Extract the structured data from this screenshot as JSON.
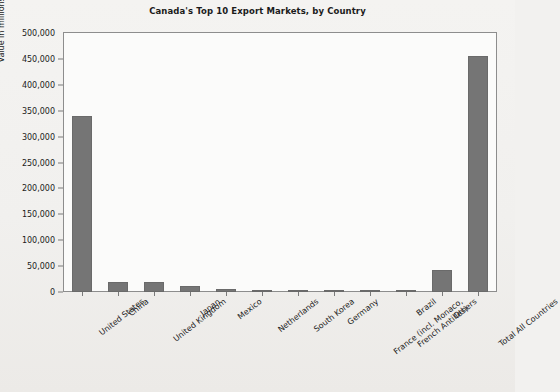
{
  "chart_data": {
    "type": "bar",
    "title": "Canada's Top 10 Export Markets, by Country",
    "xlabel": "",
    "ylabel": "Value in millions of CDN$",
    "ylim": [
      0,
      500000
    ],
    "ytick_step": 50000,
    "grid": false,
    "legend": "none",
    "bar_color": "#757575",
    "categories": [
      "United States",
      "China",
      "United Kingdom",
      "Japan",
      "Mexico",
      "Netherlands",
      "South Korea",
      "Germany",
      "France (incl. Monaco, French Antilles)",
      "Brazil",
      "Others",
      "Total All Countries"
    ],
    "category_lines": [
      [
        "United States"
      ],
      [
        "China"
      ],
      [
        "United Kingdom"
      ],
      [
        "Japan"
      ],
      [
        "Mexico"
      ],
      [
        "Netherlands"
      ],
      [
        "South Korea"
      ],
      [
        "Germany"
      ],
      [
        "France (incl. Monaco,",
        "French Antilles)"
      ],
      [
        "Brazil"
      ],
      [
        "Others"
      ],
      [
        "Total All Countries"
      ]
    ],
    "values": [
      340000,
      20000,
      19000,
      11000,
      6000,
      3500,
      3500,
      3200,
      2600,
      2000,
      42000,
      455000
    ],
    "ytick_labels": [
      "500,000",
      "450,000",
      "400,000",
      "350,000",
      "300,000",
      "250,000",
      "200,000",
      "150,000",
      "100,000",
      "50,000",
      "0"
    ],
    "ytick_values": [
      500000,
      450000,
      400000,
      350000,
      300000,
      250000,
      200000,
      150000,
      100000,
      50000,
      0
    ]
  }
}
